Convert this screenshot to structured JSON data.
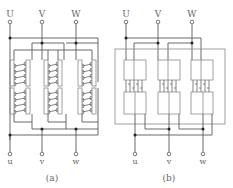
{
  "figure": {
    "panels": [
      {
        "id": "a",
        "caption": "(a)",
        "top_terminals": [
          "U",
          "V",
          "W"
        ],
        "bottom_terminals": [
          "u",
          "v",
          "w"
        ],
        "winding_style": "helical coils"
      },
      {
        "id": "b",
        "caption": "(b)",
        "top_terminals": [
          "U",
          "V",
          "W"
        ],
        "bottom_terminals": [
          "u",
          "v",
          "w"
        ],
        "winding_style": "disc windings"
      }
    ]
  },
  "colors": {
    "line": "#5a5a5a",
    "frame": "#8a8a8a",
    "junction": "#222222",
    "text": "#666666",
    "background": "#ffffff"
  }
}
